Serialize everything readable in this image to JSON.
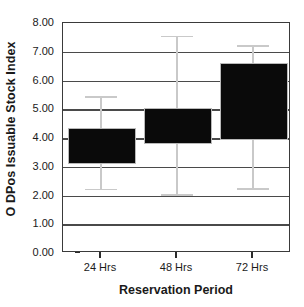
{
  "chart_data": {
    "type": "bar",
    "title": "",
    "xlabel": "Reservation Period",
    "ylabel": "O DPos Issuable Stock Index",
    "categories": [
      "24 Hrs",
      "48 Hrs",
      "72 Hrs"
    ],
    "values": [
      4.35,
      5.05,
      6.61
    ],
    "bar_bottoms": [
      3.17,
      3.86,
      4.0
    ],
    "error_upper": [
      5.46,
      7.55,
      7.22
    ],
    "error_lower": [
      2.23,
      2.05,
      2.25
    ],
    "ylim": [
      0.0,
      8.0
    ],
    "ytick_values": [
      0.0,
      1.0,
      2.0,
      3.0,
      4.0,
      5.0,
      6.0,
      7.0,
      8.0
    ],
    "ytick_labels": [
      "0.00",
      "1.00",
      "2.00",
      "3.00",
      "4.00",
      "5.00",
      "6.00",
      "7.00",
      "8.00"
    ],
    "grid": true,
    "legend": "none",
    "bar_color": "#0a0a0a",
    "error_color": "#c9c9c9",
    "grid_color": "#4a4a4a",
    "axis_color": "#3a3a3a",
    "background": "#ffffff"
  }
}
